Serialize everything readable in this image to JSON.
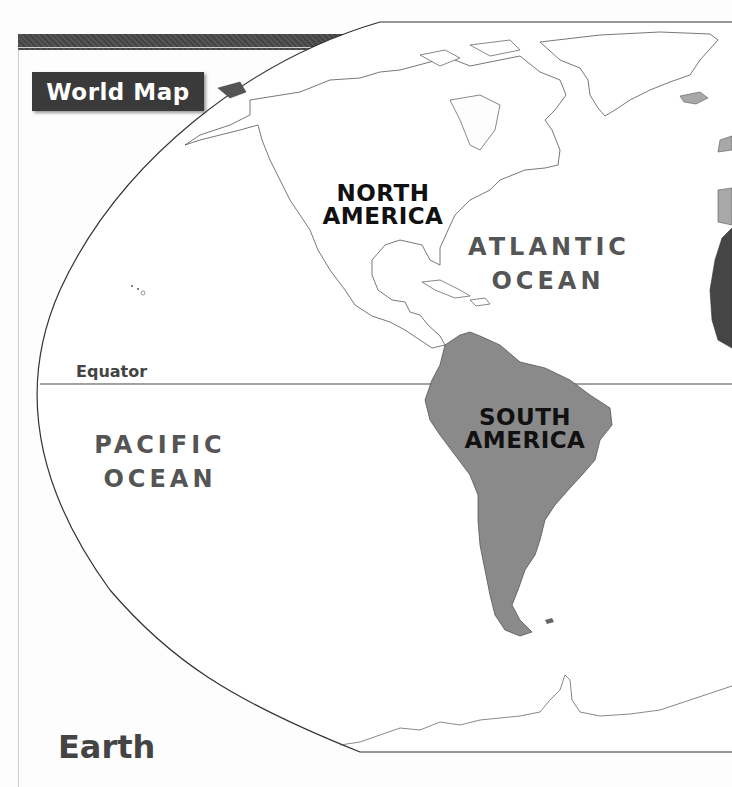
{
  "page": {
    "badge_title": "World Map",
    "footer_title": "Earth"
  },
  "map": {
    "equator_label": "Equator",
    "continents": [
      {
        "name_line1": "NORTH",
        "name_line2": "AMERICA",
        "fill": "#ffffff"
      },
      {
        "name_line1": "SOUTH",
        "name_line2": "AMERICA",
        "fill": "#8a8a8a"
      }
    ],
    "oceans": [
      {
        "name_line1": "ATLANTIC",
        "name_line2": "OCEAN"
      },
      {
        "name_line1": "PACIFIC",
        "name_line2": "OCEAN"
      }
    ],
    "colors": {
      "north_america": "#ffffff",
      "south_america": "#8a8a8a",
      "africa": "#454545",
      "europe": "#a8a8a8",
      "outline": "#333333",
      "badge_bg": "#3a3a3a"
    }
  }
}
